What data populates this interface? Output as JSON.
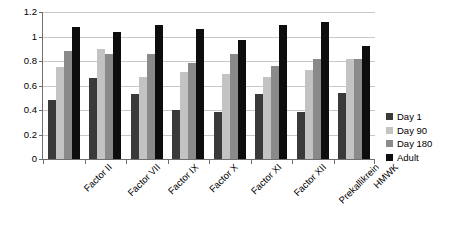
{
  "chart_data": {
    "type": "bar",
    "title": "",
    "subtitle": "",
    "xlabel": "",
    "ylabel": "",
    "ylim": [
      0,
      1.2
    ],
    "yticks": [
      0,
      0.2,
      0.4,
      0.6,
      0.8,
      1,
      1.2
    ],
    "ytick_labels": [
      "0",
      "0.2",
      "0.4",
      "0.6",
      "0.8",
      "1",
      "1.2"
    ],
    "grid": "horizontal",
    "legend_position": "right",
    "categories": [
      "Factor II",
      "Factor VII",
      "Factor IX",
      "Factor X",
      "Factor XI",
      "Factor XII",
      "Prekallikrein",
      "HMWK"
    ],
    "series": [
      {
        "name": "Day 1",
        "color": "#3a3a3a",
        "values": [
          0.48,
          0.66,
          0.53,
          0.4,
          0.38,
          0.53,
          0.38,
          0.54
        ]
      },
      {
        "name": "Day 90",
        "color": "#c3c3c3",
        "values": [
          0.75,
          0.9,
          0.67,
          0.71,
          0.69,
          0.67,
          0.73,
          0.82
        ]
      },
      {
        "name": "Day 180",
        "color": "#8a8a8a",
        "values": [
          0.88,
          0.86,
          0.86,
          0.78,
          0.86,
          0.76,
          0.82,
          0.82
        ]
      },
      {
        "name": "Adult",
        "color": "#0d0d0d",
        "values": [
          1.08,
          1.04,
          1.09,
          1.06,
          0.97,
          1.09,
          1.12,
          0.92
        ]
      }
    ]
  },
  "legend": {
    "items": [
      {
        "label": "Day 1"
      },
      {
        "label": "Day 90"
      },
      {
        "label": "Day 180"
      },
      {
        "label": "Adult"
      }
    ]
  }
}
